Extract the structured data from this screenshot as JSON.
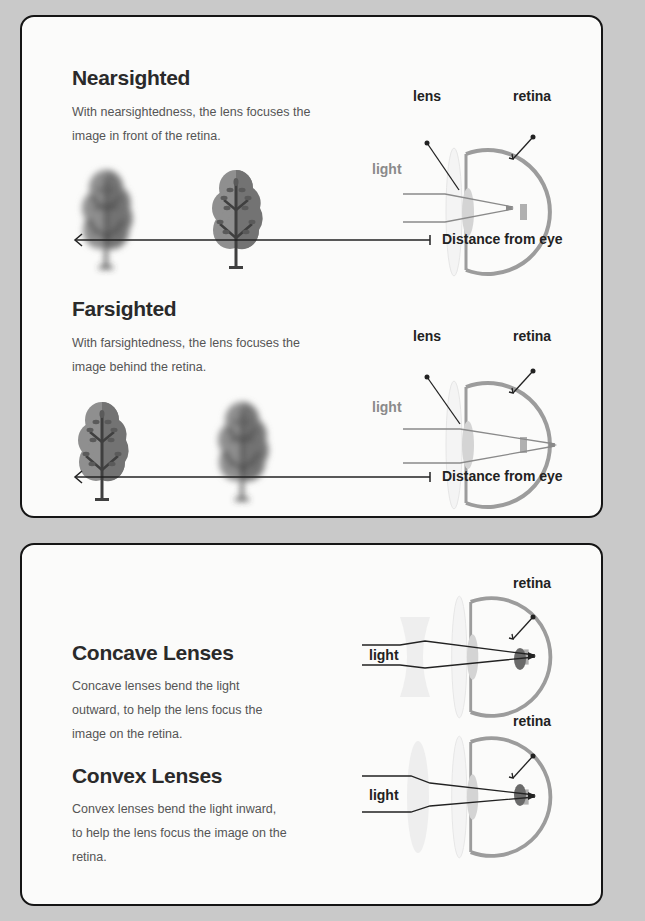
{
  "sections": {
    "nearsighted": {
      "title": "Nearsighted",
      "description": "With nearsightedness, the lens focuses the image in front of the retina.",
      "labels": {
        "lens": "lens",
        "retina": "retina",
        "light": "light"
      },
      "axis_label": "Distance from eye",
      "trees": [
        {
          "state": "blurry"
        },
        {
          "state": "sharp"
        }
      ]
    },
    "farsighted": {
      "title": "Farsighted",
      "description": "With farsightedness, the lens focuses the image behind the retina.",
      "labels": {
        "lens": "lens",
        "retina": "retina",
        "light": "light"
      },
      "axis_label": "Distance from eye",
      "trees": [
        {
          "state": "sharp"
        },
        {
          "state": "blurry"
        }
      ]
    },
    "concave": {
      "title": "Concave Lenses",
      "description": "Concave lenses bend the light outward, to help the lens focus the image on the retina.",
      "labels": {
        "retina": "retina",
        "light": "light"
      }
    },
    "convex": {
      "title": "Convex Lenses",
      "description": "Convex lenses bend the light inward, to help the lens focus the image on the retina.",
      "labels": {
        "retina": "retina",
        "light": "light"
      }
    }
  },
  "colors": {
    "background": "#c9c9c9",
    "panel": "#fbfbfa",
    "eye": "#9a9a9a",
    "tree_light": "#8e8e8e",
    "tree_dark": "#6f6f6f",
    "trunk": "#3e3e3e"
  }
}
